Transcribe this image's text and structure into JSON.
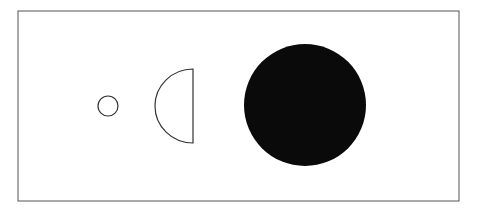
{
  "diagram": {
    "frame": {
      "x1": 18,
      "y1": 11,
      "x2": 459,
      "y2": 201,
      "stroke": "#555555"
    },
    "shapes": [
      {
        "name": "small-circle",
        "type": "circle-outline",
        "cx": 108,
        "cy": 106,
        "r": 10,
        "stroke": "#333333"
      },
      {
        "name": "half-disc",
        "type": "half-circle-outline",
        "flat_x": 193,
        "top_y": 69,
        "bottom_y": 143,
        "stroke": "#333333"
      },
      {
        "name": "large-filled-circle",
        "type": "circle-filled",
        "cx": 305,
        "cy": 105,
        "r": 61,
        "fill": "#0a0a0a"
      }
    ]
  }
}
